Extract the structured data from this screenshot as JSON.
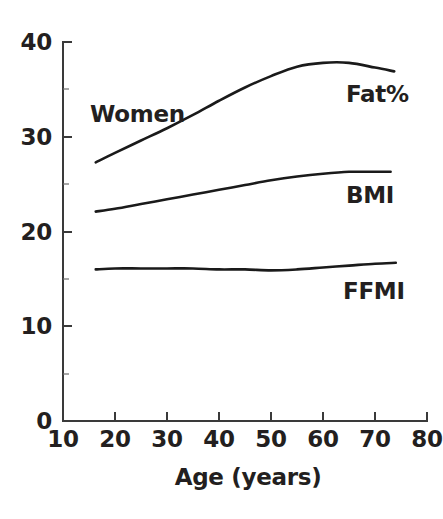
{
  "chart_data": {
    "type": "line",
    "title": "",
    "subtitle": "",
    "xlabel": "Age (years)",
    "ylabel": "",
    "xlim": [
      10,
      80
    ],
    "ylim": [
      0,
      40
    ],
    "xticks": [
      10,
      20,
      30,
      40,
      50,
      60,
      70,
      80
    ],
    "xtick_labels": [
      "10",
      "20",
      "30",
      "40",
      "50",
      "60",
      "70",
      "80"
    ],
    "yticks": [
      0,
      10,
      20,
      30,
      40
    ],
    "ytick_labels": [
      "0",
      "10",
      "20",
      "30",
      "40"
    ],
    "yticks_minor": [
      5,
      15,
      25,
      35
    ],
    "grid": false,
    "legend": "inline-right-labels",
    "annotations": [
      {
        "text": "Women",
        "x": 17.5,
        "y": 32.5
      },
      {
        "text": "Fat%",
        "x": 65.5,
        "y": 34.5
      },
      {
        "text": "BMI",
        "x": 65.5,
        "y": 24.3
      },
      {
        "text": "FFMI",
        "x": 65.0,
        "y": 14.8
      }
    ],
    "series": [
      {
        "name": "Fat%",
        "x": [
          16.3,
          20,
          25,
          30,
          35,
          40,
          45,
          50,
          55,
          60,
          65,
          70,
          73.7
        ],
        "values": [
          27.3,
          28.3,
          29.6,
          30.9,
          32.3,
          33.8,
          35.2,
          36.4,
          37.4,
          37.8,
          37.8,
          37.3,
          36.9
        ]
      },
      {
        "name": "BMI",
        "x": [
          16.3,
          20,
          25,
          30,
          35,
          40,
          45,
          50,
          55,
          60,
          65,
          70,
          73.0
        ],
        "values": [
          22.1,
          22.4,
          22.9,
          23.4,
          23.9,
          24.4,
          24.9,
          25.4,
          25.8,
          26.1,
          26.3,
          26.3,
          26.3
        ]
      },
      {
        "name": "FFMI",
        "x": [
          16.3,
          20,
          25,
          30,
          35,
          40,
          45,
          50,
          55,
          60,
          65,
          70,
          74.0
        ],
        "values": [
          16.0,
          16.1,
          16.1,
          16.1,
          16.1,
          16.0,
          16.0,
          15.9,
          16.0,
          16.2,
          16.4,
          16.6,
          16.7
        ]
      }
    ],
    "colors": {
      "line": "#1a1a1a",
      "axis": "#3a3a3a",
      "text": "#231f20",
      "background": "#ffffff"
    }
  },
  "axis": {
    "x_title": "Age (years)"
  },
  "ytick_labels": {
    "t0": "0",
    "t1": "10",
    "t2": "20",
    "t3": "30",
    "t4": "40"
  },
  "xtick_labels": {
    "t0": "10",
    "t1": "20",
    "t2": "30",
    "t3": "40",
    "t4": "50",
    "t5": "60",
    "t6": "70",
    "t7": "80"
  },
  "series_labels": {
    "women": "Women",
    "fat": "Fat%",
    "bmi": "BMI",
    "ffmi": "FFMI"
  }
}
